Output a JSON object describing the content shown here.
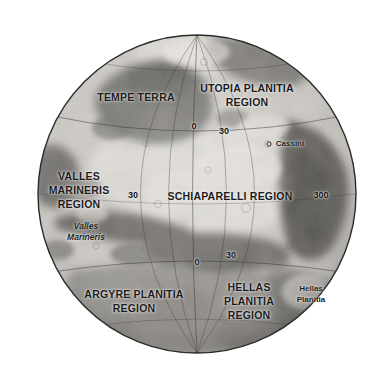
{
  "map": {
    "title": "Mars Globe Map",
    "body": "Mars",
    "projection": "orthographic globe",
    "colors": {
      "background": "#ffffff",
      "limb_outline": "#2d2d2d",
      "graticule": "#3b3b3b",
      "terrain_light": "#d9d6d1",
      "terrain_mid": "#9b9892",
      "terrain_dark": "#5e5c58",
      "label_text": "#1b1b1b"
    },
    "geometry": {
      "center_x": 197,
      "center_y": 194,
      "radius": 159
    }
  },
  "regions": [
    {
      "id": "tempe-terra",
      "label": "TEMPE TERRA",
      "x": 136,
      "y": 97
    },
    {
      "id": "utopia-planitia",
      "label": "UTOPIA PLANITIA\nREGION",
      "x": 247,
      "y": 95
    },
    {
      "id": "valles-marineris",
      "label": "VALLES\nMARINERIS\nREGION",
      "x": 79,
      "y": 190
    },
    {
      "id": "schiaparelli",
      "label": "SCHIAPARELLI REGION",
      "x": 230,
      "y": 196
    },
    {
      "id": "argyre-planitia",
      "label": "ARGYRE PLANITIA\nREGION",
      "x": 134,
      "y": 301
    },
    {
      "id": "hellas-planitia",
      "label": "HELLAS\nPLANITIA\nREGION",
      "x": 249,
      "y": 301
    }
  ],
  "features": [
    {
      "id": "cassini",
      "label": "Cassini",
      "x": 290,
      "y": 143,
      "style": "plain",
      "dot_x": 269,
      "dot_y": 144
    },
    {
      "id": "valles-marineris-feature",
      "label": "Valles\nMarineris",
      "x": 86,
      "y": 232,
      "style": "italic"
    },
    {
      "id": "hellas-planitia-feature",
      "label": "Hellas\nPlanitia",
      "x": 311,
      "y": 294,
      "style": "plain"
    }
  ],
  "graticule_labels": [
    {
      "id": "lon-0-north",
      "label": "0",
      "x": 194,
      "y": 126
    },
    {
      "id": "lon-30-north",
      "label": "30",
      "x": 224,
      "y": 131
    },
    {
      "id": "lon-300-east",
      "label": "300",
      "x": 321,
      "y": 195
    },
    {
      "id": "lon-30-west",
      "label": "30",
      "x": 133,
      "y": 195
    },
    {
      "id": "lon-30-south",
      "label": "30",
      "x": 231,
      "y": 255
    },
    {
      "id": "lon-0-south",
      "label": "0",
      "x": 197,
      "y": 262
    }
  ]
}
